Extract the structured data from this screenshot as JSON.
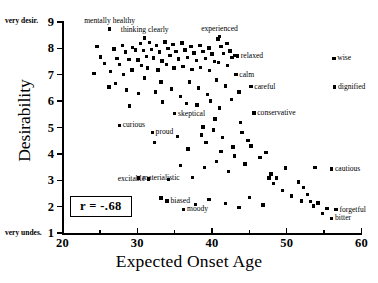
{
  "chart_data": {
    "type": "scatter",
    "title": "",
    "xlabel": "Expected Onset Age",
    "ylabel": "Desirability",
    "xlim": [
      20,
      60
    ],
    "ylim": [
      1,
      9
    ],
    "xticks": [
      20,
      30,
      40,
      50,
      60
    ],
    "xticks_minor": [
      25,
      35,
      45,
      55
    ],
    "yticks": [
      1,
      2,
      3,
      4,
      5,
      6,
      7,
      8,
      9
    ],
    "grid": false,
    "legend": null,
    "annotations": {
      "correlation": "r = -.68",
      "y_axis_high_end": "very desir.",
      "y_axis_low_end": "very undes."
    },
    "labeled_points": [
      {
        "label": "mentally healthy",
        "x": 26.3,
        "y": 8.75,
        "anchor": "top"
      },
      {
        "label": "thinking clearly",
        "x": 31.0,
        "y": 8.4,
        "anchor": "top"
      },
      {
        "label": "experienced",
        "x": 41.0,
        "y": 8.45,
        "anchor": "top"
      },
      {
        "label": "relaxed",
        "x": 43.4,
        "y": 7.72,
        "anchor": "right"
      },
      {
        "label": "calm",
        "x": 43.2,
        "y": 7.0,
        "anchor": "right"
      },
      {
        "label": "careful",
        "x": 45.2,
        "y": 6.55,
        "anchor": "right"
      },
      {
        "label": "wise",
        "x": 56.3,
        "y": 7.62,
        "anchor": "right"
      },
      {
        "label": "dignified",
        "x": 56.4,
        "y": 6.53,
        "anchor": "right"
      },
      {
        "label": "conservative",
        "x": 45.6,
        "y": 5.55,
        "anchor": "right"
      },
      {
        "label": "skeptical",
        "x": 35.0,
        "y": 5.52,
        "anchor": "right"
      },
      {
        "label": "curious",
        "x": 27.6,
        "y": 5.08,
        "anchor": "right"
      },
      {
        "label": "proud",
        "x": 32.0,
        "y": 4.82,
        "anchor": "right"
      },
      {
        "label": "cautious",
        "x": 56.0,
        "y": 3.42,
        "anchor": "right"
      },
      {
        "label": "materialistic",
        "x": 30.2,
        "y": 3.08,
        "anchor": "right"
      },
      {
        "label": "excitable",
        "x": 31.5,
        "y": 3.05,
        "anchor": "left"
      },
      {
        "label": "biased",
        "x": 34.0,
        "y": 2.22,
        "anchor": "right"
      },
      {
        "label": "moody",
        "x": 36.2,
        "y": 1.9,
        "anchor": "right"
      },
      {
        "label": "forgetful",
        "x": 56.6,
        "y": 1.88,
        "anchor": "right"
      },
      {
        "label": "bitter",
        "x": 56.0,
        "y": 1.55,
        "anchor": "right"
      }
    ],
    "points": [
      [
        26.3,
        8.72
      ],
      [
        24.6,
        8.08
      ],
      [
        25.1,
        7.68
      ],
      [
        25.6,
        7.42
      ],
      [
        24.2,
        7.05
      ],
      [
        26.9,
        7.98
      ],
      [
        27.3,
        7.62
      ],
      [
        27.6,
        7.38
      ],
      [
        26.4,
        7.12
      ],
      [
        28.0,
        8.12
      ],
      [
        28.4,
        7.86
      ],
      [
        28.9,
        7.58
      ],
      [
        28.2,
        7.02
      ],
      [
        27.1,
        6.66
      ],
      [
        29.4,
        8.04
      ],
      [
        29.8,
        7.94
      ],
      [
        30.1,
        7.56
      ],
      [
        29.3,
        7.18
      ],
      [
        30.4,
        8.18
      ],
      [
        30.8,
        7.92
      ],
      [
        31.2,
        7.7
      ],
      [
        30.6,
        7.34
      ],
      [
        31.6,
        8.22
      ],
      [
        31.9,
        7.96
      ],
      [
        32.2,
        7.64
      ],
      [
        31.4,
        7.26
      ],
      [
        32.6,
        8.1
      ],
      [
        33.0,
        7.86
      ],
      [
        33.3,
        7.52
      ],
      [
        32.8,
        7.18
      ],
      [
        33.7,
        8.24
      ],
      [
        34.1,
        8.0
      ],
      [
        34.4,
        7.74
      ],
      [
        33.9,
        7.4
      ],
      [
        34.8,
        8.14
      ],
      [
        35.2,
        7.88
      ],
      [
        35.5,
        7.6
      ],
      [
        34.9,
        7.26
      ],
      [
        36.0,
        8.2
      ],
      [
        36.4,
        7.94
      ],
      [
        36.7,
        7.66
      ],
      [
        36.1,
        7.32
      ],
      [
        37.2,
        8.06
      ],
      [
        37.6,
        7.82
      ],
      [
        37.9,
        7.54
      ],
      [
        37.3,
        7.2
      ],
      [
        38.4,
        8.12
      ],
      [
        38.8,
        7.88
      ],
      [
        39.1,
        7.62
      ],
      [
        38.5,
        7.28
      ],
      [
        39.6,
        8.02
      ],
      [
        40.0,
        7.78
      ],
      [
        40.3,
        7.5
      ],
      [
        39.7,
        7.16
      ],
      [
        40.8,
        8.36
      ],
      [
        41.2,
        8.06
      ],
      [
        41.5,
        7.8
      ],
      [
        40.9,
        7.46
      ],
      [
        42.0,
        8.18
      ],
      [
        42.4,
        7.9
      ],
      [
        42.7,
        7.66
      ],
      [
        42.1,
        7.34
      ],
      [
        43.0,
        7.72
      ],
      [
        43.4,
        7.7
      ],
      [
        43.2,
        7.0
      ],
      [
        45.2,
        6.55
      ],
      [
        26.2,
        6.54
      ],
      [
        28.6,
        6.42
      ],
      [
        30.2,
        6.3
      ],
      [
        31.0,
        6.88
      ],
      [
        33.2,
        6.72
      ],
      [
        34.6,
        6.46
      ],
      [
        35.8,
        6.18
      ],
      [
        37.0,
        6.72
      ],
      [
        38.2,
        6.5
      ],
      [
        39.4,
        6.26
      ],
      [
        40.6,
        6.8
      ],
      [
        41.8,
        6.58
      ],
      [
        43.6,
        6.34
      ],
      [
        36.6,
        5.92
      ],
      [
        38.0,
        5.86
      ],
      [
        39.8,
        6.0
      ],
      [
        41.0,
        5.74
      ],
      [
        42.6,
        6.06
      ],
      [
        35.0,
        5.52
      ],
      [
        33.4,
        5.96
      ],
      [
        32.4,
        6.34
      ],
      [
        29.0,
        5.82
      ],
      [
        27.6,
        5.08
      ],
      [
        32.0,
        4.82
      ],
      [
        32.3,
        4.44
      ],
      [
        35.4,
        4.66
      ],
      [
        36.8,
        4.18
      ],
      [
        38.6,
        4.72
      ],
      [
        39.2,
        4.44
      ],
      [
        40.2,
        4.9
      ],
      [
        41.4,
        4.62
      ],
      [
        42.8,
        4.26
      ],
      [
        44.0,
        4.82
      ],
      [
        44.8,
        4.5
      ],
      [
        45.6,
        5.55
      ],
      [
        43.8,
        5.18
      ],
      [
        40.4,
        5.32
      ],
      [
        38.8,
        5.02
      ],
      [
        46.4,
        3.86
      ],
      [
        44.4,
        3.62
      ],
      [
        42.2,
        3.34
      ],
      [
        40.6,
        3.7
      ],
      [
        39.0,
        3.48
      ],
      [
        37.4,
        3.1
      ],
      [
        35.8,
        3.56
      ],
      [
        34.2,
        3.02
      ],
      [
        30.2,
        3.08
      ],
      [
        31.5,
        3.05
      ],
      [
        33.2,
        2.32
      ],
      [
        34.0,
        2.22
      ],
      [
        36.2,
        1.9
      ],
      [
        37.8,
        2.08
      ],
      [
        39.6,
        2.26
      ],
      [
        41.8,
        2.12
      ],
      [
        43.6,
        1.96
      ],
      [
        45.0,
        2.34
      ],
      [
        46.8,
        2.06
      ],
      [
        48.2,
        2.88
      ],
      [
        47.6,
        3.08
      ],
      [
        47.9,
        3.24
      ],
      [
        49.4,
        2.62
      ],
      [
        50.6,
        2.4
      ],
      [
        51.6,
        2.94
      ],
      [
        52.2,
        2.72
      ],
      [
        52.0,
        2.22
      ],
      [
        52.8,
        2.46
      ],
      [
        53.2,
        2.2
      ],
      [
        53.6,
        2.02
      ],
      [
        54.2,
        2.14
      ],
      [
        54.8,
        1.74
      ],
      [
        55.4,
        1.92
      ],
      [
        56.0,
        1.55
      ],
      [
        56.6,
        1.88
      ],
      [
        53.8,
        3.48
      ],
      [
        56.0,
        3.42
      ],
      [
        49.8,
        3.46
      ],
      [
        47.2,
        4.06
      ],
      [
        45.2,
        4.3
      ],
      [
        43.0,
        3.92
      ],
      [
        41.2,
        4.08
      ],
      [
        48.6,
        3.08
      ]
    ]
  }
}
